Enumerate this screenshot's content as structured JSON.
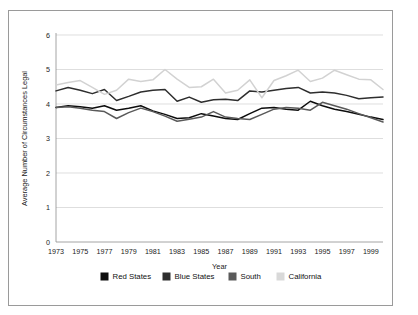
{
  "chart_data": {
    "type": "line",
    "title": "",
    "xlabel": "Year",
    "ylabel": "Average Number of Circumstances Legal",
    "xlim": [
      1973,
      2000
    ],
    "ylim": [
      0,
      6
    ],
    "yticks": [
      0,
      1,
      2,
      3,
      4,
      5,
      6
    ],
    "grid": true,
    "legend_position": "bottom",
    "x": [
      1973,
      1974,
      1975,
      1976,
      1977,
      1978,
      1979,
      1980,
      1981,
      1982,
      1983,
      1984,
      1985,
      1986,
      1987,
      1988,
      1989,
      1990,
      1991,
      1992,
      1993,
      1994,
      1995,
      1996,
      1997,
      1998,
      1999,
      2000
    ],
    "xtick_labels": [
      "1973",
      "1975",
      "1977",
      "1979",
      "1981",
      "1983",
      "1985",
      "1987",
      "1989",
      "1991",
      "1993",
      "1995",
      "1997",
      "1999"
    ],
    "xticks": [
      1973,
      1975,
      1977,
      1979,
      1981,
      1983,
      1985,
      1987,
      1989,
      1991,
      1993,
      1995,
      1997,
      1999
    ],
    "series": [
      {
        "name": "Red States",
        "color": "#0d0d0d",
        "values": [
          3.9,
          3.95,
          3.92,
          3.88,
          3.95,
          3.82,
          3.88,
          3.95,
          3.8,
          3.7,
          3.58,
          3.6,
          3.72,
          3.65,
          3.58,
          3.55,
          3.72,
          3.88,
          3.9,
          3.85,
          3.82,
          4.08,
          3.95,
          3.85,
          3.78,
          3.7,
          3.62,
          3.55
        ]
      },
      {
        "name": "Blue States",
        "color": "#2e2e2e",
        "values": [
          4.38,
          4.48,
          4.4,
          4.3,
          4.42,
          4.1,
          4.22,
          4.35,
          4.4,
          4.42,
          4.08,
          4.2,
          4.05,
          4.12,
          4.14,
          4.1,
          4.38,
          4.35,
          4.4,
          4.45,
          4.48,
          4.32,
          4.35,
          4.32,
          4.25,
          4.15,
          4.18,
          4.2
        ]
      },
      {
        "name": "South",
        "color": "#5a5a5a",
        "values": [
          3.9,
          3.92,
          3.88,
          3.82,
          3.78,
          3.58,
          3.75,
          3.88,
          3.78,
          3.65,
          3.5,
          3.56,
          3.62,
          3.78,
          3.62,
          3.58,
          3.55,
          3.7,
          3.85,
          3.9,
          3.88,
          3.82,
          4.05,
          3.95,
          3.85,
          3.72,
          3.6,
          3.48
        ]
      },
      {
        "name": "California",
        "color": "#d2d2d2",
        "values": [
          4.55,
          4.62,
          4.68,
          4.48,
          4.28,
          4.4,
          4.72,
          4.65,
          4.7,
          5.0,
          4.72,
          4.48,
          4.5,
          4.72,
          4.32,
          4.4,
          4.7,
          4.18,
          4.68,
          4.82,
          4.98,
          4.65,
          4.75,
          4.98,
          4.85,
          4.72,
          4.7,
          4.42
        ]
      }
    ]
  },
  "legend": {
    "items": [
      {
        "label": "Red States",
        "color": "#0d0d0d"
      },
      {
        "label": "Blue States",
        "color": "#2e2e2e"
      },
      {
        "label": "South",
        "color": "#5a5a5a"
      },
      {
        "label": "California",
        "color": "#d9d9d9"
      }
    ]
  }
}
